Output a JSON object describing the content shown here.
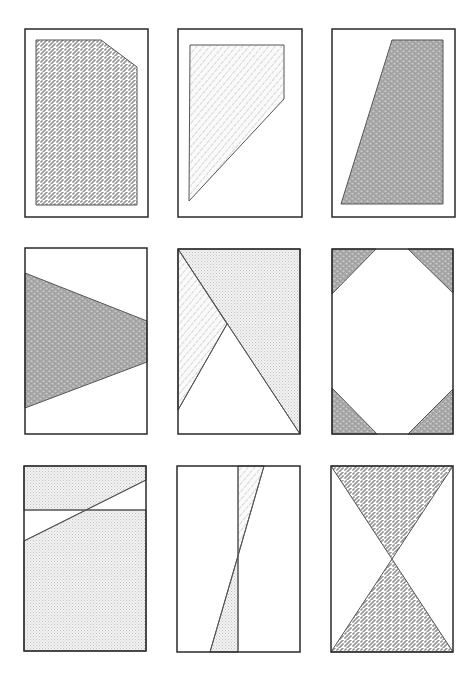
{
  "figure": {
    "layout": "3x3 grid of rectangular panels with shaded geometric regions",
    "colors": {
      "frame": "#2a2a2a",
      "edge": "#555555",
      "zigzag_stroke": "#6a6a6a",
      "dense_fill": "#a8a8a8",
      "light_dots": "#c4c4c4",
      "hatch_stroke": "#9a9a9a",
      "background": "#ffffff"
    },
    "panels": [
      {
        "id": "panel-1",
        "frame": [
          25,
          29,
          148,
          217
        ],
        "regions": [
          {
            "fill": "zigzag",
            "points": [
              [
                36,
                40
              ],
              [
                101,
                40
              ],
              [
                137,
                67
              ],
              [
                137,
                205
              ],
              [
                36,
                205
              ]
            ]
          }
        ],
        "lines": []
      },
      {
        "id": "panel-2",
        "frame": [
          178,
          29,
          302,
          217
        ],
        "regions": [
          {
            "fill": "hatch",
            "points": [
              [
                190,
                45
              ],
              [
                284,
                45
              ],
              [
                284,
                99
              ],
              [
                189,
                201
              ]
            ]
          }
        ],
        "lines": []
      },
      {
        "id": "panel-3",
        "frame": [
          332,
          29,
          455,
          217
        ],
        "regions": [
          {
            "fill": "dense",
            "points": [
              [
                392,
                40
              ],
              [
                443,
                40
              ],
              [
                443,
                204
              ],
              [
                341,
                204
              ]
            ]
          }
        ],
        "lines": []
      },
      {
        "id": "panel-4",
        "frame": [
          25,
          248,
          147,
          434
        ],
        "regions": [
          {
            "fill": "dense",
            "points": [
              [
                25,
                273
              ],
              [
                147,
                321
              ],
              [
                147,
                362
              ],
              [
                25,
                408
              ]
            ]
          }
        ],
        "lines": []
      },
      {
        "id": "panel-5",
        "frame": [
          178,
          249,
          300,
          434
        ],
        "regions": [
          {
            "fill": "dots",
            "points": [
              [
                178,
                249
              ],
              [
                300,
                249
              ],
              [
                300,
                434
              ]
            ]
          },
          {
            "fill": "hatch",
            "points": [
              [
                178,
                249
              ],
              [
                227,
                324
              ],
              [
                178,
                410
              ]
            ]
          }
        ],
        "lines": [
          [
            [
              178,
              249
            ],
            [
              300,
              434
            ]
          ],
          [
            [
              227,
              324
            ],
            [
              178,
              410
            ]
          ]
        ]
      },
      {
        "id": "panel-6",
        "frame": [
          332,
          249,
          453,
          434
        ],
        "regions": [
          {
            "fill": "dense",
            "points": [
              [
                332,
                249
              ],
              [
                376,
                249
              ],
              [
                332,
                294
              ]
            ]
          },
          {
            "fill": "dense",
            "points": [
              [
                408,
                249
              ],
              [
                453,
                249
              ],
              [
                453,
                293
              ]
            ]
          },
          {
            "fill": "dense",
            "points": [
              [
                332,
                388
              ],
              [
                377,
                434
              ],
              [
                332,
                434
              ]
            ]
          },
          {
            "fill": "dense",
            "points": [
              [
                453,
                389
              ],
              [
                453,
                434
              ],
              [
                408,
                434
              ]
            ]
          }
        ],
        "lines": []
      },
      {
        "id": "panel-7",
        "frame": [
          24,
          466,
          146,
          651
        ],
        "regions": [
          {
            "fill": "dots",
            "points": [
              [
                24,
                466
              ],
              [
                146,
                466
              ],
              [
                146,
                480
              ],
              [
                86,
                510
              ],
              [
                24,
                510
              ]
            ]
          },
          {
            "fill": "dots",
            "points": [
              [
                24,
                541
              ],
              [
                86,
                510
              ],
              [
                146,
                510
              ],
              [
                146,
                651
              ],
              [
                24,
                651
              ]
            ]
          }
        ],
        "lines": [
          [
            [
              24,
              510
            ],
            [
              146,
              510
            ]
          ],
          [
            [
              24,
              541
            ],
            [
              146,
              480
            ]
          ]
        ]
      },
      {
        "id": "panel-8",
        "frame": [
          177,
          466,
          300,
          652
        ],
        "regions": [
          {
            "fill": "hatch",
            "points": [
              [
                238,
                466
              ],
              [
                264,
                466
              ],
              [
                238,
                556
              ]
            ]
          },
          {
            "fill": "dots",
            "points": [
              [
                238,
                556
              ],
              [
                238,
                652
              ],
              [
                210,
                652
              ]
            ]
          }
        ],
        "lines": [
          [
            [
              238,
              466
            ],
            [
              238,
              652
            ]
          ],
          [
            [
              264,
              466
            ],
            [
              210,
              652
            ]
          ]
        ]
      },
      {
        "id": "panel-9",
        "frame": [
          331,
          466,
          453,
          652
        ],
        "regions": [
          {
            "fill": "zigzag",
            "points": [
              [
                331,
                466
              ],
              [
                453,
                466
              ],
              [
                392,
                559
              ]
            ]
          },
          {
            "fill": "zigzag",
            "points": [
              [
                392,
                559
              ],
              [
                453,
                652
              ],
              [
                331,
                652
              ]
            ]
          }
        ],
        "lines": []
      }
    ]
  }
}
